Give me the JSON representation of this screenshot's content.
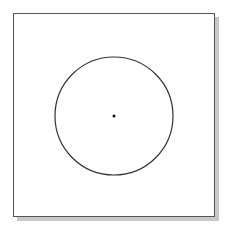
{
  "diagram": {
    "frame": {
      "stroke": "#555555",
      "shadow": "#c8c8c8"
    },
    "circle": {
      "cx": 114,
      "cy": 116,
      "r": 59,
      "stroke": "#333333"
    },
    "center_point": {
      "cx": 114,
      "cy": 116,
      "r": 1.5,
      "fill": "#111111"
    }
  }
}
